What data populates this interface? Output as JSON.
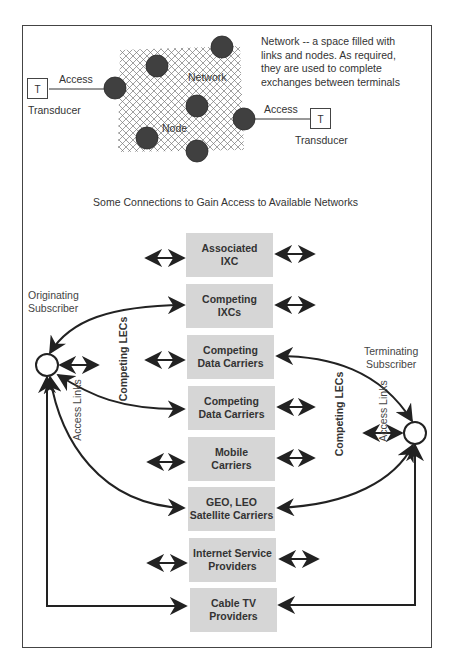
{
  "top_section": {
    "description_lines": [
      "Network -- a space filled with",
      "links and nodes. As required,",
      "they are used to complete",
      "exchanges between terminals"
    ],
    "network_label": "Network",
    "node_label": "Node",
    "left_terminal": {
      "symbol": "T",
      "label": "Transducer",
      "link_label": "Access"
    },
    "right_terminal": {
      "symbol": "T",
      "label": "Transducer",
      "link_label": "Access"
    },
    "node_color": "#404040"
  },
  "bottom_section": {
    "title": "Some Connections to Gain Access to Available Networks",
    "left_column_label": "Competing LECs",
    "right_column_label": "Competing LECs",
    "originating": {
      "line1": "Originating",
      "line2": "Subscriber"
    },
    "terminating": {
      "line1": "Terminating",
      "line2": "Subscriber"
    },
    "left_access_label": "Access Links",
    "right_access_label": "Access Links",
    "carriers": [
      {
        "line1": "Associated",
        "line2": "IXC"
      },
      {
        "line1": "Competing",
        "line2": "IXCs"
      },
      {
        "line1": "Competing",
        "line2": "Data Carriers"
      },
      {
        "line1": "Competing",
        "line2": "Data Carriers"
      },
      {
        "line1": "Mobile",
        "line2": "Carriers"
      },
      {
        "line1": "GEO, LEO",
        "line2": "Satellite Carriers"
      },
      {
        "line1": "Internet Service",
        "line2": "Providers"
      },
      {
        "line1": "Cable TV",
        "line2": "Providers"
      }
    ],
    "colors": {
      "column_fill": "#ececec",
      "box_fill": "#d6d6d6",
      "line": "#222222"
    }
  }
}
